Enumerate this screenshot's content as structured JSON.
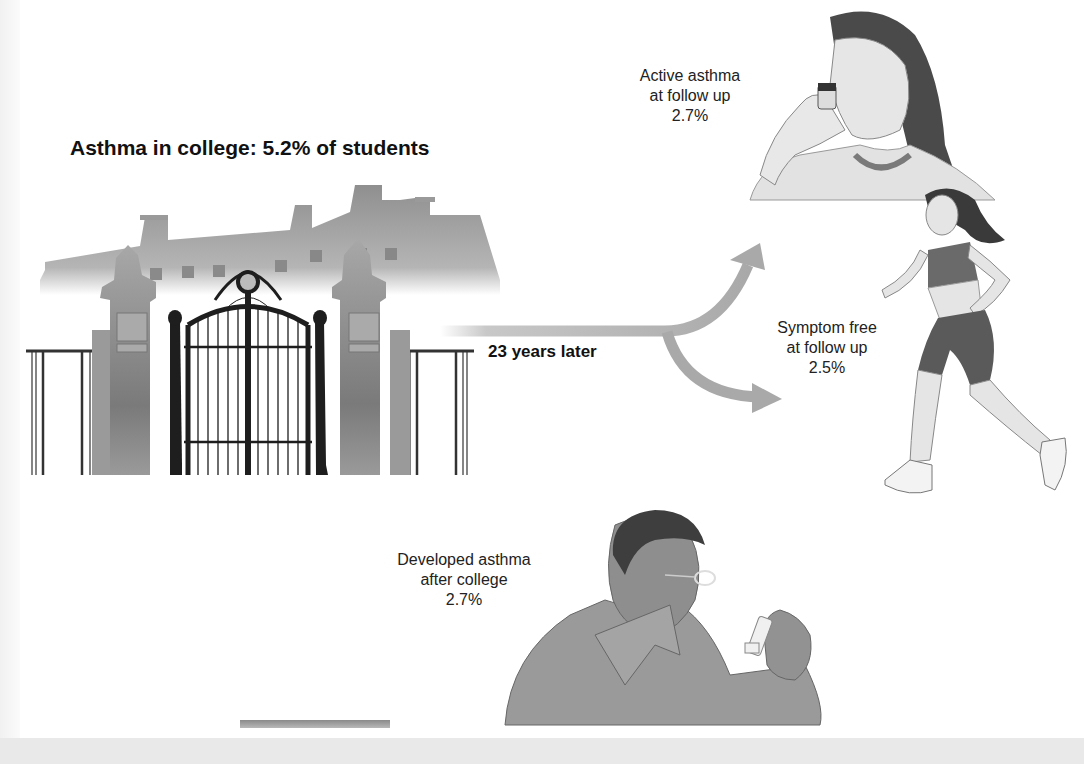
{
  "figure": {
    "title": "Asthma in college: 5.2% of students",
    "transition_label": "23 years later",
    "outcomes": [
      {
        "id": "active",
        "lines": [
          "Active asthma",
          "at follow up",
          "2.7%"
        ],
        "illustration": "woman-using-inhaler"
      },
      {
        "id": "symptom_free",
        "lines": [
          "Symptom free",
          "at follow up",
          "2.5%"
        ],
        "illustration": "woman-jogging"
      },
      {
        "id": "developed",
        "lines": [
          "Developed asthma",
          "after college",
          "2.7%"
        ],
        "illustration": "man-holding-inhaler"
      }
    ],
    "scene": {
      "illustration": "college-gate-and-building"
    },
    "colors": {
      "arrow": "#a9a9a9",
      "building": "#9a9a9a",
      "gate": "#1e1e1e",
      "pillar": "#8c8c8c",
      "background": "#ffffff"
    }
  }
}
